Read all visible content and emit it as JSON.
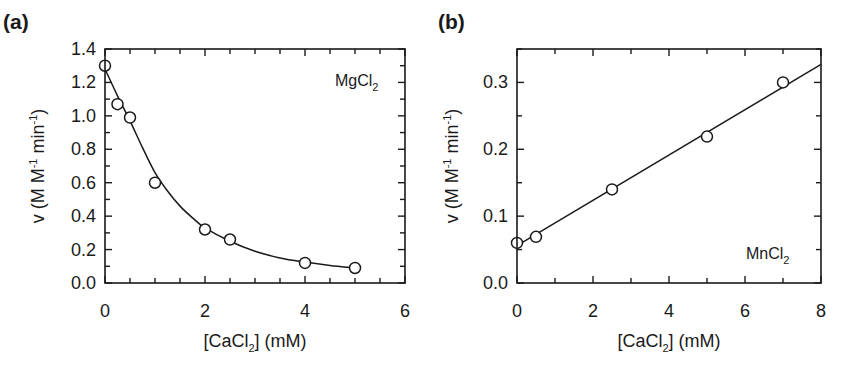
{
  "figure": {
    "panels": [
      "(a)",
      "(b)"
    ]
  },
  "chart_data": [
    {
      "type": "scatter",
      "panel_label": "(a)",
      "annotation": "MgCl2",
      "xlabel": "[CaCl2] (mM)",
      "ylabel": "v (M M-1 min-1)",
      "xlim": [
        0,
        6
      ],
      "ylim": [
        0,
        1.4
      ],
      "xticks": [
        0,
        2,
        4,
        6
      ],
      "xtick_labels": [
        "0",
        "2",
        "4",
        "6"
      ],
      "yticks": [
        0,
        0.2,
        0.4,
        0.6,
        0.8,
        1.0,
        1.2,
        1.4
      ],
      "ytick_labels": [
        "0.0",
        "0.2",
        "0.4",
        "0.6",
        "0.8",
        "1.0",
        "1.2",
        "1.4"
      ],
      "x_minor_step": 0.5,
      "y_minor_step": 0.1,
      "grid": false,
      "series": [
        {
          "name": "MgCl2 data",
          "marker": "open-circle",
          "x": [
            0,
            0.25,
            0.5,
            1.0,
            2.0,
            2.5,
            4.0,
            5.0
          ],
          "y": [
            1.3,
            1.07,
            0.99,
            0.6,
            0.32,
            0.26,
            0.12,
            0.09
          ]
        },
        {
          "name": "fit curve",
          "style": "line",
          "x": [
            0,
            0.25,
            0.5,
            0.75,
            1.0,
            1.25,
            1.5,
            1.75,
            2.0,
            2.5,
            3.0,
            3.5,
            4.0,
            4.5,
            5.0
          ],
          "y": [
            1.28,
            1.12,
            0.97,
            0.81,
            0.66,
            0.55,
            0.46,
            0.39,
            0.33,
            0.25,
            0.19,
            0.15,
            0.125,
            0.105,
            0.09
          ]
        }
      ]
    },
    {
      "type": "scatter",
      "panel_label": "(b)",
      "annotation": "MnCl2",
      "xlabel": "[CaCl2] (mM)",
      "ylabel": "v (M M-1 min-1)",
      "xlim": [
        0,
        8
      ],
      "ylim": [
        0,
        0.35
      ],
      "xticks": [
        0,
        2,
        4,
        6,
        8
      ],
      "xtick_labels": [
        "0",
        "2",
        "4",
        "6",
        "8"
      ],
      "yticks": [
        0,
        0.1,
        0.2,
        0.3
      ],
      "ytick_labels": [
        "0.0",
        "0.1",
        "0.2",
        "0.3"
      ],
      "x_minor_step": 1,
      "y_minor_step": 0.05,
      "grid": false,
      "series": [
        {
          "name": "MnCl2 data",
          "marker": "open-circle",
          "x": [
            0,
            0.5,
            2.5,
            5.0,
            7.0
          ],
          "y": [
            0.06,
            0.069,
            0.14,
            0.219,
            0.3
          ]
        },
        {
          "name": "linear fit",
          "style": "line",
          "x": [
            0,
            8
          ],
          "y": [
            0.056,
            0.327
          ]
        }
      ]
    }
  ]
}
